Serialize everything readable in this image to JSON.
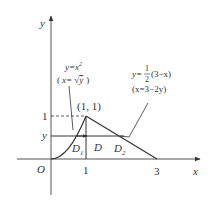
{
  "figure": {
    "axes": {
      "x_label": "x",
      "y_label": "y",
      "origin_label": "O",
      "x_ticks": [
        "1",
        "3"
      ],
      "y_ticks": [
        "1",
        "y"
      ]
    },
    "point": {
      "label": "(1, 1)"
    },
    "curve_left": {
      "equation": "y=x",
      "equation_exp": "2",
      "inverse_open": "(",
      "inverse_x": "x= ",
      "inverse_sqrt": "√",
      "inverse_arg": "y",
      "inverse_close": ")"
    },
    "curve_right": {
      "prefix": "y=",
      "frac_num": "1",
      "frac_den": "2",
      "suffix": "(3−x)",
      "inverse": "(x=3−2y)"
    },
    "regions": {
      "d1_main": "D",
      "d1_sub": "1",
      "d": "D",
      "d2_main": "D",
      "d2_sub": "2"
    },
    "colors": {
      "line": "#333333",
      "axis": "#555555",
      "text": "#333333"
    }
  }
}
